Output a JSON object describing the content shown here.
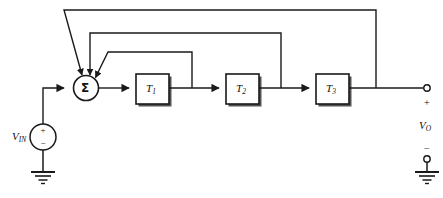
{
  "figure": {
    "type": "block-diagram",
    "background_color": "#ffffff",
    "line_color": "#1a1a1a",
    "shadow_color": "#555555"
  },
  "source": {
    "name": "input-voltage-source",
    "label_main": "V",
    "label_sub": "IN",
    "plus_sign": "+",
    "minus_sign": "−"
  },
  "summing_node": {
    "name": "summing-junction",
    "symbol": "Σ",
    "input_count": 4,
    "feedback_inputs": 3
  },
  "blocks": [
    {
      "id": "T1",
      "label_main": "T",
      "label_sub": "1"
    },
    {
      "id": "T2",
      "label_main": "T",
      "label_sub": "2"
    },
    {
      "id": "T3",
      "label_main": "T",
      "label_sub": "3"
    }
  ],
  "feedback_paths": [
    {
      "from": "T1-output",
      "to": "summing-junction",
      "level": "inner"
    },
    {
      "from": "T2-output",
      "to": "summing-junction",
      "level": "middle"
    },
    {
      "from": "T3-output",
      "to": "summing-junction",
      "level": "outer"
    }
  ],
  "output_port": {
    "name": "output-port",
    "label_main": "V",
    "label_sub": "O",
    "plus_sign": "+",
    "minus_sign": "−"
  },
  "grounds": [
    {
      "name": "input-ground"
    },
    {
      "name": "output-ground"
    }
  ]
}
